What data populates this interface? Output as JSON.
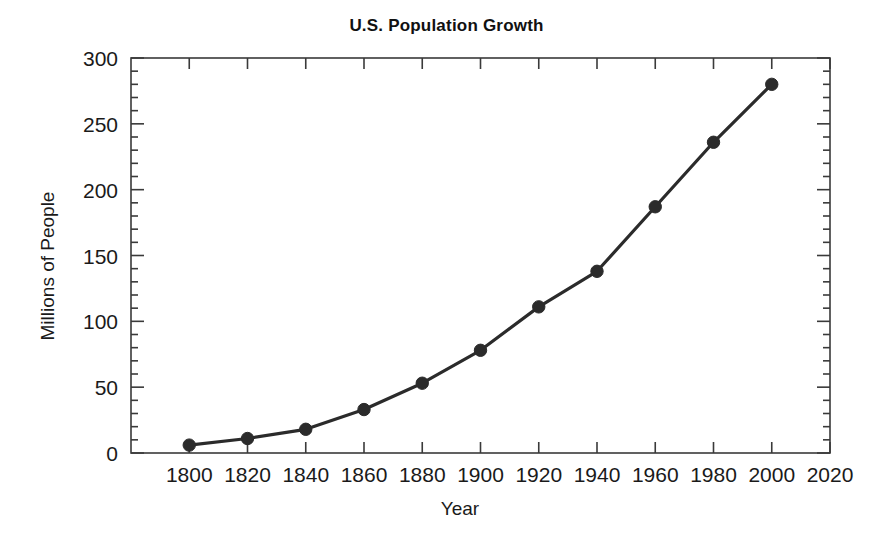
{
  "chart_data": {
    "type": "line",
    "title": "U.S. Population Growth",
    "xlabel": "Year",
    "ylabel": "Millions of People",
    "x": [
      1800,
      1820,
      1840,
      1860,
      1880,
      1900,
      1920,
      1940,
      1960,
      1980,
      2000
    ],
    "values": [
      6,
      11,
      18,
      33,
      53,
      78,
      111,
      138,
      187,
      236,
      280
    ],
    "series": [
      {
        "name": "U.S. Population",
        "x": [
          1800,
          1820,
          1840,
          1860,
          1880,
          1900,
          1920,
          1940,
          1960,
          1980,
          2000
        ],
        "values": [
          6,
          11,
          18,
          33,
          53,
          78,
          111,
          138,
          187,
          236,
          280
        ]
      }
    ],
    "xlim": [
      1780,
      2020
    ],
    "ylim": [
      0,
      300
    ],
    "xticks": [
      1800,
      1820,
      1840,
      1860,
      1880,
      1900,
      1920,
      1940,
      1960,
      1980,
      2000,
      2020
    ],
    "xtick_labels": [
      "1800",
      "1820",
      "1840",
      "1860",
      "1880",
      "1900",
      "1920",
      "1940",
      "1960",
      "1980",
      "2000",
      "2020"
    ],
    "yticks": [
      0,
      50,
      100,
      150,
      200,
      250,
      300
    ],
    "ytick_labels": [
      "0",
      "50",
      "100",
      "150",
      "200",
      "250",
      "300"
    ],
    "y_minor_step": 10,
    "grid": false,
    "legend": "none",
    "marker": "filled-circle",
    "line_color": "#2b2b2b",
    "marker_color": "#2b2b2b",
    "axis_color": "#3a3a3a",
    "background_color": "#ffffff"
  }
}
